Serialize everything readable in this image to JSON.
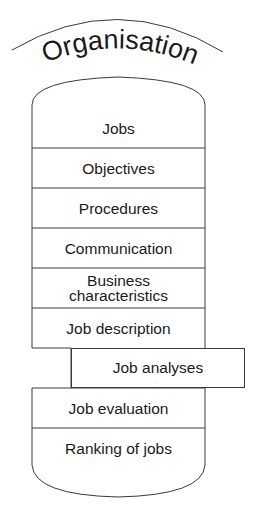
{
  "title": "Organisation",
  "cylinder": {
    "rows": [
      {
        "label": "Jobs"
      },
      {
        "label": "Objectives"
      },
      {
        "label": "Procedures"
      },
      {
        "label": "Communication"
      },
      {
        "label": "Business characteristics"
      },
      {
        "label": "Job description"
      },
      {
        "label": "Job evaluation"
      },
      {
        "label": "Ranking of jobs"
      }
    ],
    "offset_item": {
      "label": "Job analyses"
    }
  },
  "colors": {
    "stroke": "#3a3a3a",
    "text": "#1a1a1a",
    "background": "#ffffff"
  }
}
